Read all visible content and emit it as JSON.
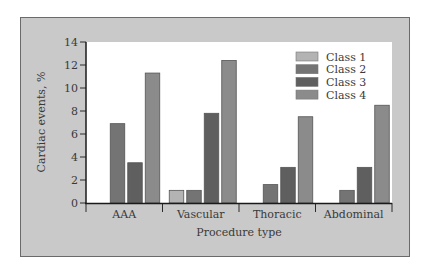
{
  "chart_data": {
    "type": "bar",
    "title": "",
    "xlabel": "Procedure type",
    "ylabel": "Cardiac events, %",
    "ylim": [
      0,
      14
    ],
    "yticks": [
      0,
      2,
      4,
      6,
      8,
      10,
      12,
      14
    ],
    "grid": false,
    "legend_position": "top-right",
    "categories": [
      "AAA",
      "Vascular",
      "Thoracic",
      "Abdominal"
    ],
    "series": [
      {
        "name": "Class 1",
        "color": "#b3b3b3",
        "values": [
          0,
          1.1,
          0,
          0
        ]
      },
      {
        "name": "Class 2",
        "color": "#747474",
        "values": [
          6.9,
          1.1,
          1.6,
          1.1
        ]
      },
      {
        "name": "Class 3",
        "color": "#5f5f5f",
        "values": [
          3.5,
          7.8,
          3.1,
          3.1
        ]
      },
      {
        "name": "Class 4",
        "color": "#8b8b8b",
        "values": [
          11.3,
          12.4,
          7.5,
          8.5
        ]
      }
    ]
  }
}
